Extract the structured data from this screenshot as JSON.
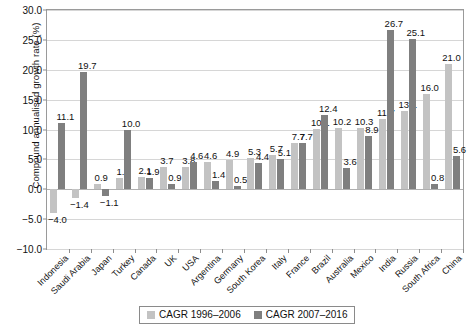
{
  "chart_data": {
    "type": "bar",
    "title": "",
    "xlabel": "",
    "ylabel": "Compound annualised growth rate (%)",
    "ylim": [
      -10.0,
      30.0
    ],
    "ytick_step": 5.0,
    "yticks": [
      "30.0",
      "25.0",
      "20.0",
      "15.0",
      "10.0",
      "5.0",
      "0.0",
      "-5.0",
      "-10.0"
    ],
    "ytick_values": [
      30.0,
      25.0,
      20.0,
      15.0,
      10.0,
      5.0,
      0.0,
      -5.0,
      -10.0
    ],
    "grid": true,
    "legend_position": "bottom-center",
    "categories": [
      "Indonesia",
      "Saudi Arabia",
      "Japan",
      "Turkey",
      "Canada",
      "UK",
      "USA",
      "Argentina",
      "Germany",
      "South Korea",
      "Italy",
      "France",
      "Brazil",
      "Australia",
      "Mexico",
      "India",
      "Russia",
      "South Africa",
      "China"
    ],
    "series": [
      {
        "name": "CAGR 1996-2006",
        "color": "#c3c3c3",
        "values": [
          -4.0,
          -1.4,
          0.9,
          1.8,
          2.1,
          3.7,
          3.8,
          4.6,
          4.9,
          5.3,
          5.7,
          7.7,
          10.1,
          10.2,
          10.3,
          11.7,
          13.1,
          16.0,
          21.0
        ],
        "labels": [
          "-4.0",
          "-1.4",
          "0.9",
          "1.8",
          "2.1",
          "3.7",
          "3.8",
          "4.6",
          "4.9",
          "5.3",
          "5.7",
          "7.7",
          "10.1",
          "10.2",
          "10.3",
          "11.7",
          "13.1",
          "16.0",
          "21.0"
        ]
      },
      {
        "name": "CAGR 2007-2016",
        "color": "#7f7f7f",
        "values": [
          11.1,
          19.7,
          -1.1,
          10.0,
          1.9,
          0.9,
          4.6,
          1.4,
          0.5,
          4.4,
          5.1,
          7.7,
          12.4,
          3.6,
          8.9,
          26.7,
          25.1,
          0.8,
          5.6
        ],
        "labels": [
          "11.1",
          "19.7",
          "-1.1",
          "10.0",
          "1.9",
          "0.9",
          "4.6",
          "1.4",
          "0.5",
          "4.4",
          "5.1",
          "7.7",
          "12.4",
          "3.6",
          "8.9",
          "26.7",
          "25.1",
          "0.8",
          "5.6"
        ]
      }
    ]
  },
  "legend": {
    "items": [
      {
        "label": "CAGR 1996–2006",
        "color": "#c3c3c3"
      },
      {
        "label": "CAGR 2007–2016",
        "color": "#7f7f7f"
      }
    ]
  }
}
